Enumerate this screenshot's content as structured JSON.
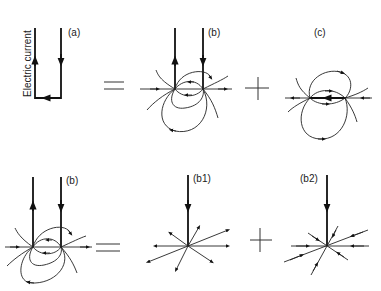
{
  "figure": {
    "vertical_label": "Electric current",
    "equals_symbol": "=",
    "plus_symbol": "+",
    "panels": {
      "a": {
        "label": "(a)"
      },
      "b_top": {
        "label": "(b)"
      },
      "c": {
        "label": "(c)"
      },
      "b_bottom": {
        "label": "(b)"
      },
      "b1": {
        "label": "(b1)"
      },
      "b2": {
        "label": "(b2)"
      }
    },
    "equations": [
      "(a) = (b) + (c)",
      "(b) = (b1) + (b2)"
    ],
    "colors": {
      "ink": "#111111",
      "background": "#ffffff"
    }
  }
}
